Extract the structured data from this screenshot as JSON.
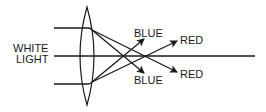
{
  "diagram": {
    "labels": {
      "input": [
        "WHITE",
        "LIGHT"
      ],
      "blue_top": "BLUE",
      "blue_bottom": "BLUE",
      "red_top": "RED",
      "red_bottom": "RED"
    },
    "colors": {
      "line": "#1a1a1a",
      "background": "#ffffff"
    }
  }
}
